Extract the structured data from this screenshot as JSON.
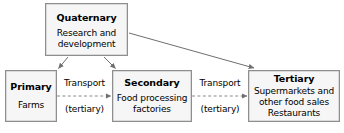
{
  "diagram": {
    "type": "flow-diagram",
    "colors": {
      "box_fill": "#f6f6f6",
      "box_border": "#8e8e8e",
      "arrow": "#6f6f6f",
      "text": "#000000",
      "background": "#ffffff"
    },
    "nodes": [
      {
        "id": "quaternary",
        "title": "Quaternary",
        "desc_lines": [
          "Research and",
          "development"
        ]
      },
      {
        "id": "primary",
        "title": "Primary",
        "desc_lines": [
          "Farms"
        ]
      },
      {
        "id": "secondary",
        "title": "Secondary",
        "desc_lines": [
          "Food processing",
          "factories"
        ]
      },
      {
        "id": "tertiary",
        "title": "Tertiary",
        "desc_lines": [
          "Supermarkets and",
          "other food sales",
          "Restaurants"
        ]
      }
    ],
    "edge_labels": {
      "transport_1": "Transport",
      "tertiary_note_1": "(tertiary)",
      "transport_2": "Transport",
      "tertiary_note_2": "(tertiary)"
    },
    "edges": [
      {
        "id": "quaternary-to-primary",
        "from": "quaternary",
        "to": "primary",
        "style": "solid",
        "label": ""
      },
      {
        "id": "quaternary-to-secondary",
        "from": "quaternary",
        "to": "secondary",
        "style": "solid",
        "label": ""
      },
      {
        "id": "quaternary-to-tertiary",
        "from": "quaternary",
        "to": "tertiary",
        "style": "solid",
        "label": ""
      },
      {
        "id": "primary-to-secondary",
        "from": "primary",
        "to": "secondary",
        "style": "dashed",
        "label": "Transport (tertiary)"
      },
      {
        "id": "secondary-to-tertiary",
        "from": "secondary",
        "to": "tertiary",
        "style": "dashed",
        "label": "Transport (tertiary)"
      }
    ]
  }
}
